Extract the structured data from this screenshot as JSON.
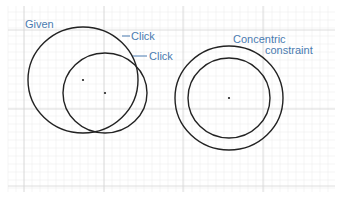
{
  "diagram": {
    "background": "#ffffff",
    "grid": {
      "minor_color": "#eeeeee",
      "major_color": "#d6d6d6",
      "minor_spacing": 8,
      "major_x": [
        24,
        104,
        183,
        263
      ],
      "major_y": [
        30,
        109,
        186
      ]
    },
    "label_color": "#4a7bb0",
    "stroke_color": "#222222",
    "labels": {
      "given": "Given",
      "click_1": "Click",
      "click_2": "Click",
      "concentric_line1": "Concentric",
      "concentric_line2": "constraint"
    },
    "left_group": {
      "given_circle": {
        "cx": 83,
        "cy": 80,
        "rx": 55,
        "ry": 53
      },
      "clicked_circle": {
        "cx": 105,
        "cy": 93,
        "rx": 42,
        "ry": 40
      }
    },
    "right_group": {
      "outer_circle": {
        "cx": 229,
        "cy": 98,
        "rx": 54,
        "ry": 52
      },
      "inner_circle": {
        "cx": 229,
        "cy": 98,
        "rx": 41,
        "ry": 40
      }
    }
  }
}
